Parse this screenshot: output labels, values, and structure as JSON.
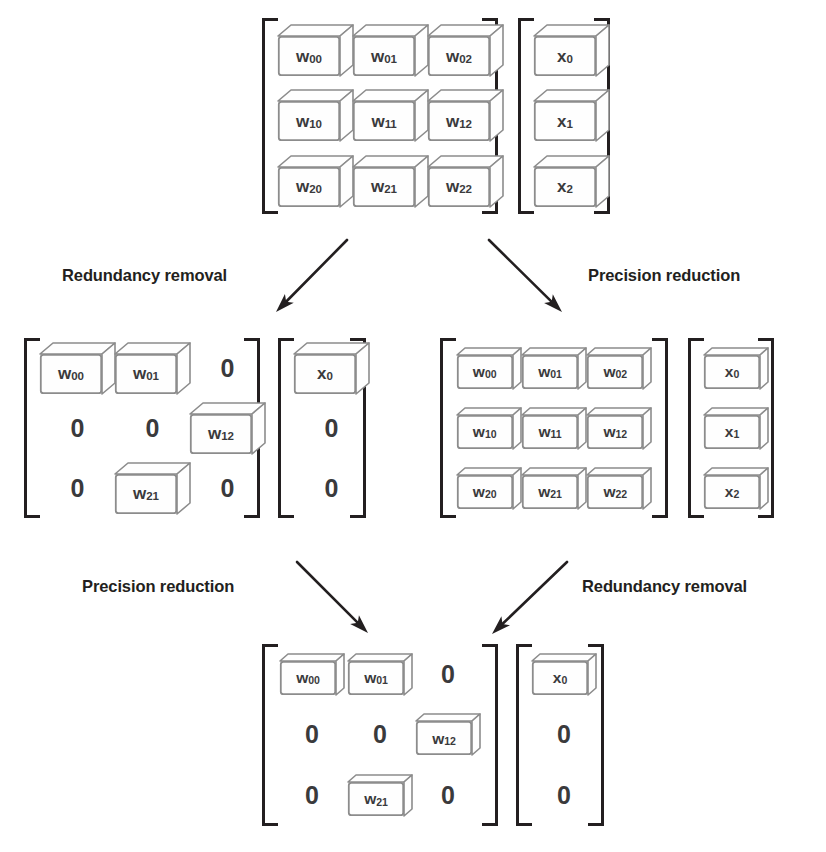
{
  "figure": {
    "background_color": "#ffffff",
    "bracket_color": "#231f20",
    "cube_stroke_color": "#8c8c8c",
    "cube_fill_color": "#fefefe",
    "text_color": "#3a3a3c",
    "caption_color": "#231f20",
    "zero_label": "0"
  },
  "captions": {
    "top_left": "Redundancy removal",
    "top_right": "Precision reduction",
    "bottom_left": "Precision reduction",
    "bottom_right": "Redundancy removal"
  },
  "stages": {
    "original": {
      "name": "original-dense-full-precision",
      "weight_matrix": {
        "rows": [
          [
            {
              "type": "cube",
              "base": "w",
              "sub": "00"
            },
            {
              "type": "cube",
              "base": "w",
              "sub": "01"
            },
            {
              "type": "cube",
              "base": "w",
              "sub": "02"
            }
          ],
          [
            {
              "type": "cube",
              "base": "w",
              "sub": "10"
            },
            {
              "type": "cube",
              "base": "w",
              "sub": "11"
            },
            {
              "type": "cube",
              "base": "w",
              "sub": "12"
            }
          ],
          [
            {
              "type": "cube",
              "base": "w",
              "sub": "20"
            },
            {
              "type": "cube",
              "base": "w",
              "sub": "21"
            },
            {
              "type": "cube",
              "base": "w",
              "sub": "22"
            }
          ]
        ]
      },
      "input_vector": {
        "rows": [
          [
            {
              "type": "cube",
              "base": "x",
              "sub": "0"
            }
          ],
          [
            {
              "type": "cube",
              "base": "x",
              "sub": "1"
            }
          ],
          [
            {
              "type": "cube",
              "base": "x",
              "sub": "2"
            }
          ]
        ]
      }
    },
    "sparse": {
      "name": "sparse-full-precision",
      "weight_matrix": {
        "rows": [
          [
            {
              "type": "cube",
              "base": "w",
              "sub": "00"
            },
            {
              "type": "cube",
              "base": "w",
              "sub": "01"
            },
            {
              "type": "zero"
            }
          ],
          [
            {
              "type": "zero"
            },
            {
              "type": "zero"
            },
            {
              "type": "cube",
              "base": "w",
              "sub": "12"
            }
          ],
          [
            {
              "type": "zero"
            },
            {
              "type": "cube",
              "base": "w",
              "sub": "21"
            },
            {
              "type": "zero"
            }
          ]
        ]
      },
      "input_vector": {
        "rows": [
          [
            {
              "type": "cube",
              "base": "x",
              "sub": "0"
            }
          ],
          [
            {
              "type": "zero"
            }
          ],
          [
            {
              "type": "zero"
            }
          ]
        ]
      }
    },
    "quantized": {
      "name": "dense-reduced-precision",
      "weight_matrix": {
        "rows": [
          [
            {
              "type": "cube",
              "base": "w",
              "sub": "00"
            },
            {
              "type": "cube",
              "base": "w",
              "sub": "01"
            },
            {
              "type": "cube",
              "base": "w",
              "sub": "02"
            }
          ],
          [
            {
              "type": "cube",
              "base": "w",
              "sub": "10"
            },
            {
              "type": "cube",
              "base": "w",
              "sub": "11"
            },
            {
              "type": "cube",
              "base": "w",
              "sub": "12"
            }
          ],
          [
            {
              "type": "cube",
              "base": "w",
              "sub": "20"
            },
            {
              "type": "cube",
              "base": "w",
              "sub": "21"
            },
            {
              "type": "cube",
              "base": "w",
              "sub": "22"
            }
          ]
        ]
      },
      "input_vector": {
        "rows": [
          [
            {
              "type": "cube",
              "base": "x",
              "sub": "0"
            }
          ],
          [
            {
              "type": "cube",
              "base": "x",
              "sub": "1"
            }
          ],
          [
            {
              "type": "cube",
              "base": "x",
              "sub": "2"
            }
          ]
        ]
      }
    },
    "final": {
      "name": "sparse-reduced-precision",
      "weight_matrix": {
        "rows": [
          [
            {
              "type": "cube",
              "base": "w",
              "sub": "00"
            },
            {
              "type": "cube",
              "base": "w",
              "sub": "01"
            },
            {
              "type": "zero"
            }
          ],
          [
            {
              "type": "zero"
            },
            {
              "type": "zero"
            },
            {
              "type": "cube",
              "base": "w",
              "sub": "12"
            }
          ],
          [
            {
              "type": "zero"
            },
            {
              "type": "cube",
              "base": "w",
              "sub": "21"
            },
            {
              "type": "zero"
            }
          ]
        ]
      },
      "input_vector": {
        "rows": [
          [
            {
              "type": "cube",
              "base": "x",
              "sub": "0"
            }
          ],
          [
            {
              "type": "zero"
            }
          ],
          [
            {
              "type": "zero"
            }
          ]
        ]
      }
    }
  },
  "layout": {
    "groups": [
      {
        "key": "original.weight_matrix",
        "name": "matrix-original-weights",
        "x": 262,
        "y": 18,
        "w": 236,
        "h": 196,
        "cols": 3,
        "cube": "thick"
      },
      {
        "key": "original.input_vector",
        "name": "vector-original-input",
        "x": 518,
        "y": 18,
        "w": 92,
        "h": 196,
        "cols": 1,
        "cube": "thick"
      },
      {
        "key": "sparse.weight_matrix",
        "name": "matrix-sparse-weights",
        "x": 24,
        "y": 338,
        "w": 236,
        "h": 180,
        "cols": 3,
        "cube": "thick"
      },
      {
        "key": "sparse.input_vector",
        "name": "vector-sparse-input",
        "x": 278,
        "y": 338,
        "w": 88,
        "h": 180,
        "cols": 1,
        "cube": "thick"
      },
      {
        "key": "quantized.weight_matrix",
        "name": "matrix-quantized-weights",
        "x": 440,
        "y": 338,
        "w": 228,
        "h": 180,
        "cols": 3,
        "cube": "thin"
      },
      {
        "key": "quantized.input_vector",
        "name": "vector-quantized-input",
        "x": 688,
        "y": 338,
        "w": 86,
        "h": 180,
        "cols": 1,
        "cube": "thin"
      },
      {
        "key": "final.weight_matrix",
        "name": "matrix-final-weights",
        "x": 262,
        "y": 644,
        "w": 236,
        "h": 182,
        "cols": 3,
        "cube": "thin"
      },
      {
        "key": "final.input_vector",
        "name": "vector-final-input",
        "x": 516,
        "y": 644,
        "w": 88,
        "h": 182,
        "cols": 1,
        "cube": "thin"
      }
    ],
    "arrows": [
      {
        "name": "arrow-redundancy-removal-top",
        "x1": 347,
        "y1": 240,
        "x2": 276,
        "y2": 312
      },
      {
        "name": "arrow-precision-reduction-top",
        "x1": 489,
        "y1": 240,
        "x2": 562,
        "y2": 312
      },
      {
        "name": "arrow-precision-reduction-bottom",
        "x1": 297,
        "y1": 562,
        "x2": 368,
        "y2": 633
      },
      {
        "name": "arrow-redundancy-removal-bottom",
        "x1": 567,
        "y1": 562,
        "x2": 492,
        "y2": 634
      }
    ],
    "captions": [
      {
        "name": "caption-redundancy-removal-top",
        "bind": "captions.top_left",
        "x": 62,
        "y": 267
      },
      {
        "name": "caption-precision-reduction-top",
        "bind": "captions.top_right",
        "x": 588,
        "y": 267
      },
      {
        "name": "caption-precision-reduction-bottom",
        "bind": "captions.bottom_left",
        "x": 82,
        "y": 578
      },
      {
        "name": "caption-redundancy-removal-bottom",
        "bind": "captions.bottom_right",
        "x": 582,
        "y": 578
      }
    ]
  }
}
